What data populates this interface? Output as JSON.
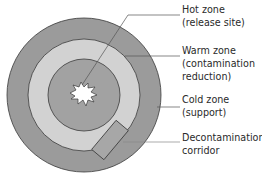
{
  "diagram": {
    "type": "concentric-zones",
    "colors": {
      "outer_ring": "#9b9b9b",
      "middle_ring": "#d2d2d2",
      "inner_circle": "#a2a2a2",
      "corridor": "#a7a7a7",
      "starburst": "#ffffff",
      "stroke": "#3a3a3a",
      "leader": "#555555"
    },
    "labels": [
      {
        "id": "hot",
        "line1": "Hot zone",
        "line2": "(release site)"
      },
      {
        "id": "warm",
        "line1": "Warm zone",
        "line2": "(contamination",
        "line3": "reduction)"
      },
      {
        "id": "cold",
        "line1": "Cold zone",
        "line2": "(support)"
      },
      {
        "id": "decon",
        "line1": "Decontamination",
        "line2": "corridor"
      }
    ]
  }
}
